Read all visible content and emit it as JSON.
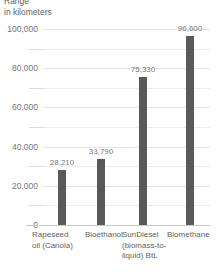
{
  "title": {
    "line1": "Range",
    "line2": "in kilometers"
  },
  "chart_data": {
    "type": "bar",
    "title": "Range in kilometers",
    "xlabel": "",
    "ylabel": "in kilometers",
    "categories": [
      "Rapeseed oil (Canola)",
      "Bioethanol",
      "SunDiesel (biomass-to-liquid) BtL",
      "Biomethane"
    ],
    "category_lines": [
      [
        "Rapeseed",
        "oil (Canola)"
      ],
      [
        "Bioethanol"
      ],
      [
        "SunDiesel",
        "(biomass-to-",
        "liquid) BtL"
      ],
      [
        "Biomethane"
      ]
    ],
    "values": [
      28210,
      33790,
      75330,
      96600
    ],
    "value_labels": [
      "28,210",
      "33,790",
      "75,330",
      "96,600"
    ],
    "ylim": [
      0,
      100000
    ],
    "yticks": [
      0,
      20000,
      40000,
      60000,
      80000,
      100000
    ],
    "ytick_labels": [
      "0",
      "20,000",
      "40,000",
      "60,000",
      "80,000",
      "100,000"
    ],
    "minor_yticks": [
      10000,
      30000,
      50000,
      70000,
      90000
    ],
    "grid": true,
    "legend": null,
    "bar_color": "#595959",
    "gridline_color": "#ededed",
    "axis_color": "#c9c9c9",
    "label_color": "#5f5f5f"
  }
}
